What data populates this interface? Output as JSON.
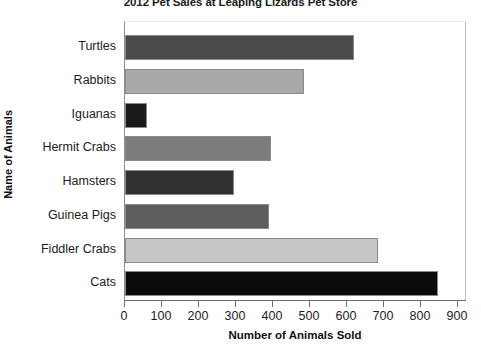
{
  "chart_data": {
    "type": "bar",
    "orientation": "horizontal",
    "title": "2012 Pet Sales at Leaping Lizards Pet Store",
    "xlabel": "Number of Animals Sold",
    "ylabel": "Name of Animals",
    "xlim": [
      0,
      900
    ],
    "xticks": [
      0,
      100,
      200,
      300,
      400,
      500,
      600,
      700,
      800,
      900
    ],
    "xtick_labels": [
      "0",
      "100",
      "200",
      "300",
      "400",
      "500",
      "600",
      "700",
      "800",
      "900"
    ],
    "grid": false,
    "legend": false,
    "categories": [
      "Turtles",
      "Rabbits",
      "Iguanas",
      "Hermit Crabs",
      "Hamsters",
      "Guinea Pigs",
      "Fiddler Crabs",
      "Cats"
    ],
    "values": [
      620,
      485,
      60,
      395,
      295,
      390,
      685,
      845
    ],
    "bars": [
      {
        "label": "Turtles",
        "value": 620,
        "color": "#4a4a4a"
      },
      {
        "label": "Rabbits",
        "value": 485,
        "color": "#a9a9a9"
      },
      {
        "label": "Iguanas",
        "value": 60,
        "color": "#1a1a1a"
      },
      {
        "label": "Hermit Crabs",
        "value": 395,
        "color": "#7c7c7c"
      },
      {
        "label": "Hamsters",
        "value": 295,
        "color": "#313131"
      },
      {
        "label": "Guinea Pigs",
        "value": 390,
        "color": "#5e5e5e"
      },
      {
        "label": "Fiddler Crabs",
        "value": 685,
        "color": "#c6c6c6"
      },
      {
        "label": "Cats",
        "value": 845,
        "color": "#0b0b0b"
      }
    ]
  }
}
